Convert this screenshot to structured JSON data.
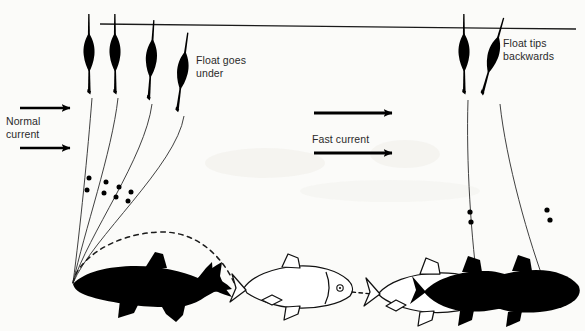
{
  "figure": {
    "background_color": "#fbfbf9",
    "ink_color": "#000000",
    "text_color": "#2a2a2a",
    "width": 585,
    "height": 331
  },
  "labels": {
    "float_goes_under": "Float goes\nunder",
    "float_tips_backwards": "Float tips\nbackwards",
    "normal_current": "Normal\ncurrent",
    "fast_current": "Fast current"
  },
  "waterline": {
    "name": "water surface line",
    "x1": 100,
    "y1": 24,
    "x2": 576,
    "y2": 29
  },
  "floats_left": [
    {
      "id": 1,
      "x": 88,
      "top_y": 20,
      "tilt_deg": 0,
      "state": "upright"
    },
    {
      "id": 2,
      "x": 114,
      "top_y": 20,
      "tilt_deg": 0,
      "state": "upright"
    },
    {
      "id": 3,
      "x": 150,
      "top_y": 26,
      "tilt_deg": 4,
      "state": "sinking"
    },
    {
      "id": 4,
      "x": 181,
      "top_y": 38,
      "tilt_deg": 8,
      "state": "submerged"
    }
  ],
  "floats_right": [
    {
      "id": 5,
      "x": 463,
      "top_y": 20,
      "tilt_deg": 0,
      "state": "upright"
    },
    {
      "id": 6,
      "x": 491,
      "top_y": 22,
      "tilt_deg": 16,
      "state": "tipped-backwards"
    }
  ],
  "shot_count_per_line": 2,
  "arrows": {
    "normal_current": [
      {
        "x1": 20,
        "y": 108,
        "x2": 74
      },
      {
        "x1": 20,
        "y": 148,
        "x2": 74
      }
    ],
    "fast_current": [
      {
        "x1": 314,
        "y": 113,
        "x2": 396
      },
      {
        "x1": 314,
        "y": 153,
        "x2": 396
      }
    ]
  },
  "fish": [
    {
      "id": "fish-left-black",
      "style": "solid-black",
      "facing": "left",
      "role": "fish taking bait at line convergence"
    },
    {
      "id": "fish-middle-outline",
      "style": "outline",
      "facing": "right",
      "role": "fish swimming away"
    },
    {
      "id": "fish-right-outline",
      "style": "outline",
      "facing": "left",
      "role": "fish in fast current"
    },
    {
      "id": "fish-right-black-1",
      "style": "solid-black",
      "facing": "left",
      "role": "fish overlapping"
    },
    {
      "id": "fish-right-black-2",
      "style": "solid-black",
      "facing": "left",
      "role": "fish at right line"
    }
  ],
  "bait_trajectory": {
    "name": "dashed bait path",
    "style": "dashed",
    "from": [
      73,
      283
    ],
    "to": [
      236,
      288
    ]
  },
  "line_convergence_point": [
    73,
    283
  ]
}
